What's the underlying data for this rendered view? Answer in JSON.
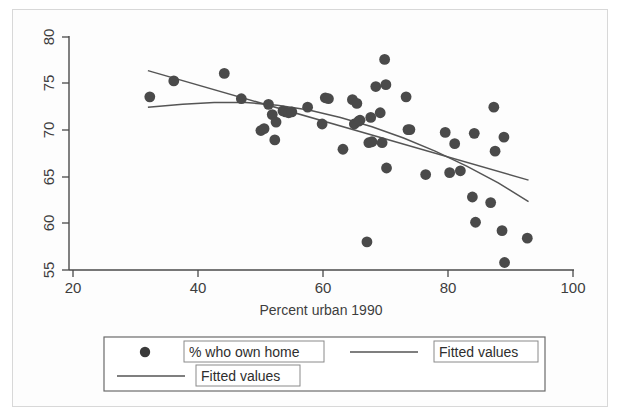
{
  "chart_data": {
    "type": "scatter",
    "title": "",
    "subtitle": "",
    "xlabel": "Percent urban 1990",
    "ylabel": "",
    "xlim": [
      20,
      100
    ],
    "ylim": [
      55,
      80
    ],
    "xticks": [
      20,
      40,
      60,
      80,
      100
    ],
    "yticks": [
      55,
      60,
      65,
      70,
      75,
      80
    ],
    "xtick_labels": [
      "20",
      "40",
      "60",
      "80",
      "100"
    ],
    "ytick_labels": [
      "55",
      "60",
      "65",
      "70",
      "75",
      "80"
    ],
    "grid": false,
    "y_tick_label_rotation": -90,
    "legend_position": "below-plot",
    "marker_color": "#4a4a4a",
    "line_color": "#555555",
    "axis_color": "#4a4a4a",
    "background_color": "#ffffff",
    "series": [
      {
        "name": "% who own home",
        "type": "scatter",
        "marker": "filled-circle",
        "points": [
          [
            32.8,
            73.5
          ],
          [
            36.6,
            75.2
          ],
          [
            44.6,
            76.0
          ],
          [
            47.3,
            73.3
          ],
          [
            50.4,
            69.9
          ],
          [
            50.9,
            70.1
          ],
          [
            51.6,
            72.7
          ],
          [
            52.2,
            71.6
          ],
          [
            52.6,
            68.9
          ],
          [
            52.8,
            70.8
          ],
          [
            53.9,
            72.0
          ],
          [
            54.3,
            71.9
          ],
          [
            54.8,
            71.8
          ],
          [
            55.3,
            71.9
          ],
          [
            57.8,
            72.4
          ],
          [
            60.1,
            70.6
          ],
          [
            60.6,
            73.4
          ],
          [
            61.1,
            73.3
          ],
          [
            63.4,
            67.9
          ],
          [
            64.9,
            73.2
          ],
          [
            65.2,
            70.6
          ],
          [
            65.6,
            72.8
          ],
          [
            65.9,
            70.9
          ],
          [
            66.1,
            71.0
          ],
          [
            67.2,
            58.0
          ],
          [
            67.5,
            68.6
          ],
          [
            67.8,
            71.3
          ],
          [
            68.0,
            68.7
          ],
          [
            68.6,
            74.6
          ],
          [
            69.3,
            71.8
          ],
          [
            69.6,
            68.6
          ],
          [
            70.0,
            77.5
          ],
          [
            70.2,
            74.8
          ],
          [
            70.3,
            65.9
          ],
          [
            73.4,
            73.5
          ],
          [
            73.7,
            70.0
          ],
          [
            74.0,
            70.0
          ],
          [
            76.5,
            65.2
          ],
          [
            79.6,
            69.7
          ],
          [
            80.3,
            65.4
          ],
          [
            81.1,
            68.5
          ],
          [
            82.0,
            65.6
          ],
          [
            83.9,
            62.8
          ],
          [
            84.2,
            69.6
          ],
          [
            84.4,
            60.1
          ],
          [
            86.8,
            62.2
          ],
          [
            87.3,
            72.4
          ],
          [
            87.5,
            67.7
          ],
          [
            88.6,
            59.2
          ],
          [
            88.9,
            69.2
          ],
          [
            89.0,
            55.8
          ],
          [
            92.6,
            58.4
          ]
        ]
      },
      {
        "name": "Fitted values",
        "type": "line",
        "fit": "linear",
        "points": [
          [
            32.5,
            76.3
          ],
          [
            92.8,
            64.6
          ]
        ]
      },
      {
        "name": "Fitted values",
        "type": "line",
        "fit": "quadratic",
        "points": [
          [
            32.5,
            72.4
          ],
          [
            38.0,
            72.7
          ],
          [
            43.0,
            72.9
          ],
          [
            48.0,
            72.9
          ],
          [
            53.0,
            72.6
          ],
          [
            58.0,
            72.1
          ],
          [
            63.0,
            71.3
          ],
          [
            68.0,
            70.3
          ],
          [
            73.0,
            69.1
          ],
          [
            78.0,
            67.7
          ],
          [
            83.0,
            66.1
          ],
          [
            88.0,
            64.3
          ],
          [
            92.8,
            62.3
          ]
        ]
      }
    ]
  },
  "legend": {
    "entries": [
      {
        "label": "% who own home",
        "key": "marker"
      },
      {
        "label": "Fitted values",
        "key": "line"
      },
      {
        "label": "Fitted values",
        "key": "line"
      }
    ]
  }
}
